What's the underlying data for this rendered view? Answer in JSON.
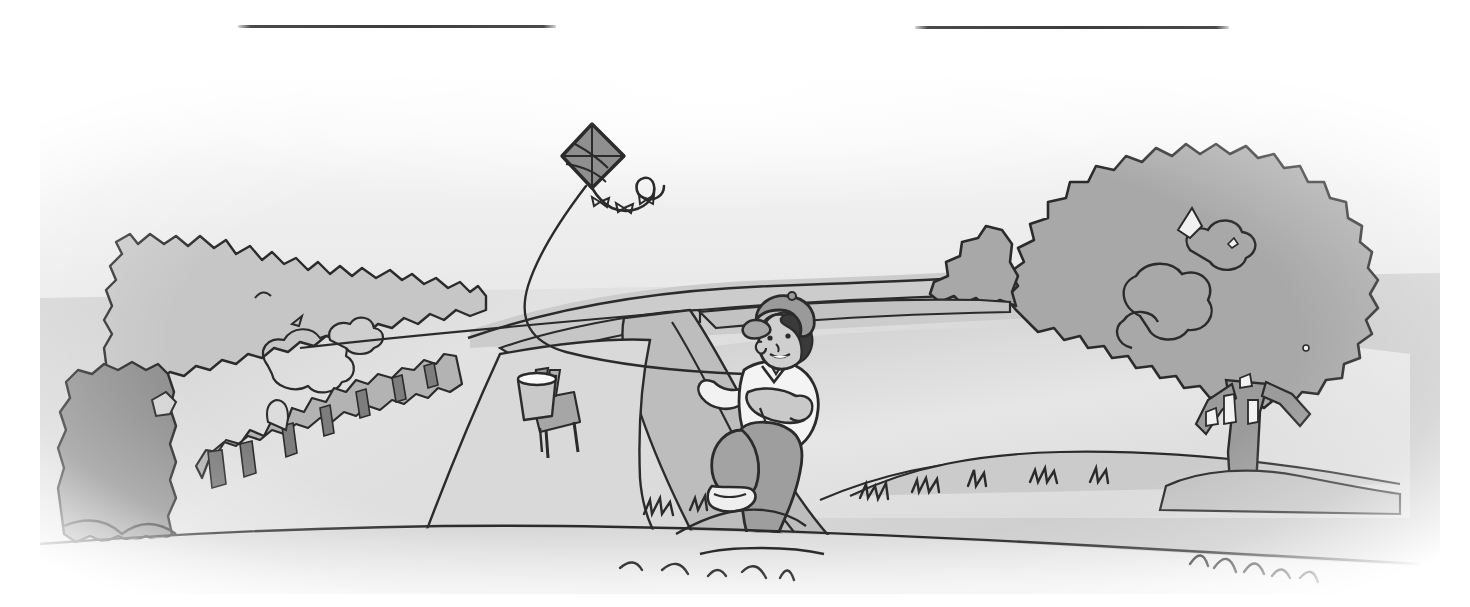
{
  "page": {
    "background_color": "#ffffff",
    "width": 1470,
    "height": 607
  },
  "rules": [
    {
      "name": "rule-left",
      "x": 238,
      "y": 25,
      "width": 318,
      "color": "#3d3d3d"
    },
    {
      "name": "rule-right",
      "x": 915,
      "y": 26,
      "width": 314,
      "color": "#3d3d3d"
    }
  ],
  "illustration": {
    "style": "grayscale line art with soft vignette edges",
    "caption": "A boy in a cap runs along a winding path flying a diamond kite; trees and hedges flank a grassy field.",
    "palette": {
      "paper": "#ffffff",
      "sky": "#e9e9e9",
      "sky_highlight": "#fdfdfd",
      "ground_light": "#d8d8d8",
      "ground_mid": "#c7c7c7",
      "foliage_light": "#c3c3c3",
      "foliage_mid": "#a9a9a9",
      "foliage_dark": "#8d8d8d",
      "shadow_dark": "#6e6e6e",
      "path_light": "#d2d2d2",
      "path_mid": "#b5b5b5",
      "ink": "#2b2b2b",
      "skin": "#cfcfcf",
      "shirt": "#f2f2f2",
      "trousers": "#a0a0a0",
      "cap": "#9a9a9a",
      "hair": "#3a3a3a"
    },
    "elements": [
      {
        "name": "kite",
        "label": "Diamond kite",
        "x": 592,
        "y": 104
      },
      {
        "name": "kite-tail",
        "label": "Curly kite tail with bows",
        "x": 620,
        "y": 150
      },
      {
        "name": "kite-string",
        "label": "Kite string",
        "x": 620,
        "y": 250
      },
      {
        "name": "boy",
        "label": "Boy running with cap",
        "x": 780,
        "y": 390
      },
      {
        "name": "chair",
        "label": "Chair with pail",
        "x": 545,
        "y": 370
      },
      {
        "name": "tree-right",
        "label": "Large tree on the right",
        "x": 1230,
        "y": 250
      },
      {
        "name": "bush-left",
        "label": "Bushes on the left",
        "x": 240,
        "y": 240
      },
      {
        "name": "bush-dark-left",
        "label": "Dark bush at far left",
        "x": 130,
        "y": 400
      },
      {
        "name": "hedge-row",
        "label": "Hedge / fence row",
        "x": 330,
        "y": 380
      },
      {
        "name": "path",
        "label": "Winding dirt path",
        "x": 660,
        "y": 400
      },
      {
        "name": "grass-foreground",
        "label": "Foreground grass tufts",
        "x": 760,
        "y": 520
      },
      {
        "name": "horizon",
        "label": "Horizon line",
        "x": 900,
        "y": 252
      }
    ]
  }
}
